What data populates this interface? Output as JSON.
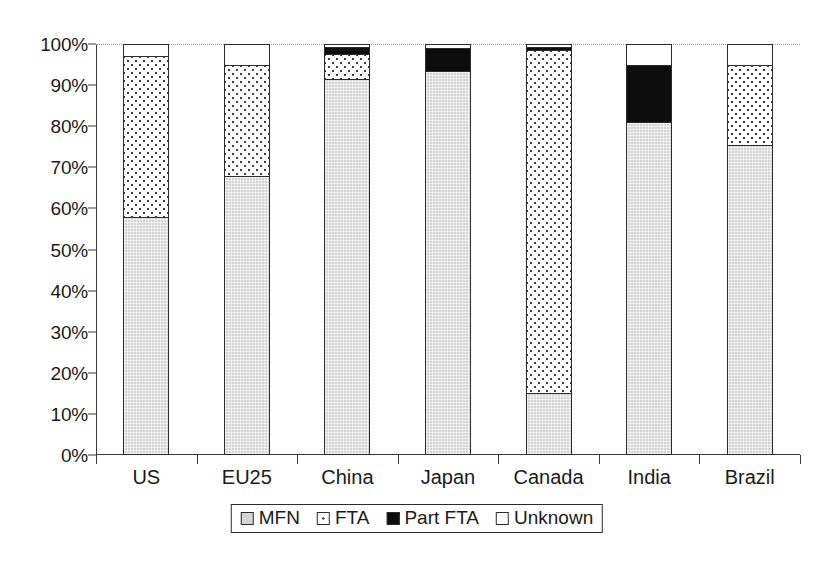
{
  "chart_data": {
    "type": "bar",
    "subtype": "stacked-100-percent",
    "title": "",
    "xlabel": "",
    "ylabel": "",
    "ylim": [
      0,
      100
    ],
    "ytick_labels": [
      "0%",
      "10%",
      "20%",
      "30%",
      "40%",
      "50%",
      "60%",
      "70%",
      "80%",
      "90%",
      "100%"
    ],
    "ytick_values": [
      0,
      10,
      20,
      30,
      40,
      50,
      60,
      70,
      80,
      90,
      100
    ],
    "grid": "top-gridline-only",
    "legend_position": "bottom-center",
    "categories": [
      "US",
      "EU25",
      "China",
      "Japan",
      "Canada",
      "India",
      "Brazil"
    ],
    "series": [
      {
        "name": "MFN",
        "color": "#d4d4d4",
        "pattern": "solid-light-gray",
        "values": [
          58.0,
          68.0,
          91.5,
          93.5,
          15.0,
          81.0,
          75.5
        ]
      },
      {
        "name": "FTA",
        "color": "#ffffff",
        "pattern": "dotted",
        "values": [
          39.0,
          27.0,
          6.0,
          0.0,
          83.5,
          0.0,
          19.5
        ]
      },
      {
        "name": "Part FTA",
        "color": "#0d0d0d",
        "pattern": "solid-black",
        "values": [
          0.0,
          0.0,
          1.8,
          5.5,
          0.8,
          14.0,
          0.0
        ]
      },
      {
        "name": "Unknown",
        "color": "#ffffff",
        "pattern": "solid-white",
        "values": [
          3.0,
          5.0,
          0.7,
          1.0,
          0.7,
          5.0,
          5.0
        ]
      }
    ]
  },
  "legend": {
    "items": [
      {
        "label": "MFN",
        "swatch": "sw-mfn"
      },
      {
        "label": "FTA",
        "swatch": "sw-fta"
      },
      {
        "label": "Part FTA",
        "swatch": "sw-partfta"
      },
      {
        "label": "Unknown",
        "swatch": "sw-unknown"
      }
    ]
  }
}
